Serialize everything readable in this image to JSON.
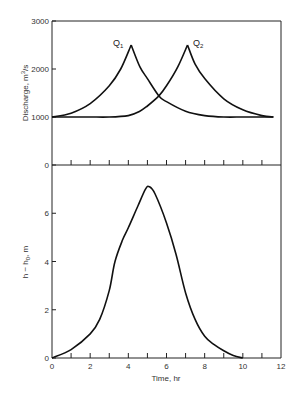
{
  "chart_data": [
    {
      "type": "line",
      "panel": "upper",
      "title": "",
      "xlabel": "",
      "ylabel": "Discharge, m³/s",
      "xlim": [
        0,
        12
      ],
      "ylim": [
        0,
        3000
      ],
      "yticks": [
        0,
        1000,
        2000,
        3000
      ],
      "ytick_labels": [
        "0",
        "1000",
        "2000",
        "3000"
      ],
      "grid": false,
      "series": [
        {
          "name": "Q1",
          "x": [
            0,
            1,
            2,
            3,
            3.6,
            4.15,
            4.6,
            5,
            5.6,
            6,
            7,
            8,
            9,
            10,
            11,
            11.6
          ],
          "y": [
            1000,
            1080,
            1280,
            1650,
            2000,
            2500,
            2050,
            1800,
            1440,
            1320,
            1120,
            1030,
            1000,
            1000,
            1000,
            1000
          ]
        },
        {
          "name": "Q2",
          "x": [
            0,
            1,
            2,
            3,
            4,
            4.6,
            5,
            5.6,
            6,
            6.6,
            7.1,
            7.5,
            8,
            9,
            10,
            11,
            11.6
          ],
          "y": [
            1000,
            1000,
            1000,
            1000,
            1030,
            1120,
            1230,
            1440,
            1650,
            2050,
            2500,
            2100,
            1800,
            1380,
            1150,
            1030,
            1000
          ]
        }
      ],
      "annotations": [
        {
          "text": "Q1",
          "x": 3.6,
          "y": 2450
        },
        {
          "text": "Q2",
          "x": 7.3,
          "y": 2450
        }
      ]
    },
    {
      "type": "line",
      "panel": "lower",
      "title": "",
      "xlabel": "Time, hr",
      "ylabel": "h − h₀, m",
      "xlim": [
        0,
        12
      ],
      "ylim": [
        0,
        8
      ],
      "xticks": [
        0,
        2,
        4,
        6,
        8,
        10,
        12
      ],
      "xtick_labels": [
        "0",
        "2",
        "4",
        "6",
        "8",
        "10",
        "12"
      ],
      "yticks": [
        0,
        2,
        4,
        6
      ],
      "ytick_labels": [
        "0",
        "2",
        "4",
        "6"
      ],
      "grid": false,
      "series": [
        {
          "name": "h - h0",
          "x": [
            0,
            1,
            2,
            2.5,
            3,
            3.3,
            3.7,
            4,
            4.5,
            4.9,
            5.1,
            5.4,
            6,
            6.5,
            7,
            7.5,
            8,
            8.5,
            9,
            9.5,
            10
          ],
          "y": [
            0,
            0.35,
            1.0,
            1.6,
            2.8,
            4.0,
            4.9,
            5.4,
            6.3,
            7.0,
            7.1,
            6.8,
            5.6,
            4.3,
            2.7,
            1.6,
            0.9,
            0.55,
            0.3,
            0.1,
            0
          ]
        }
      ]
    }
  ],
  "labels": {
    "upper_ylabel_text": "Discharge, m",
    "upper_ylabel_sup": "3",
    "upper_ylabel_tail": "/s",
    "lower_ylabel_text": "h − h",
    "lower_ylabel_sub": "0",
    "lower_ylabel_tail": ", m",
    "xlabel": "Time, hr",
    "q1": "Q",
    "q1_sub": "1",
    "q2": "Q",
    "q2_sub": "2"
  }
}
